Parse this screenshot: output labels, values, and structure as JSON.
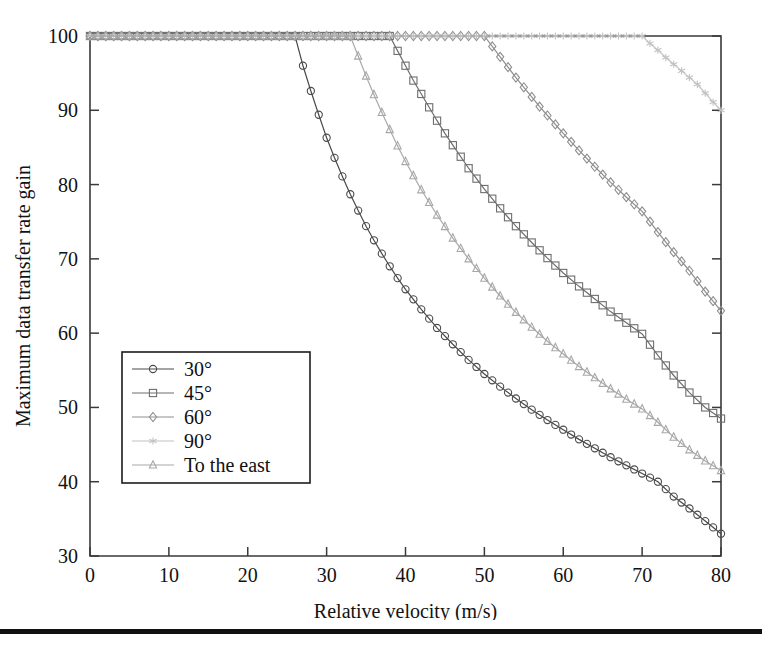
{
  "figure": {
    "background": "#ffffff",
    "bottom_rule_color": "#111111",
    "frame_color": "#3a3a3a"
  },
  "chart_data": {
    "type": "line",
    "title": "",
    "xlabel": "Relative velocity (m/s)",
    "ylabel": "Maximum data transfer rate gain",
    "xlim": [
      0,
      80
    ],
    "ylim": [
      30,
      100
    ],
    "xticks": [
      0,
      10,
      20,
      30,
      40,
      50,
      60,
      70,
      80
    ],
    "yticks": [
      30,
      40,
      50,
      60,
      70,
      80,
      90,
      100
    ],
    "xtick_labels": [
      "0",
      "10",
      "20",
      "30",
      "40",
      "50",
      "60",
      "70",
      "80"
    ],
    "ytick_labels": [
      "30",
      "40",
      "50",
      "60",
      "70",
      "80",
      "90",
      "100"
    ],
    "grid": false,
    "legend_position": "center-left",
    "marker_interval_x": 1,
    "series": [
      {
        "name": "30°",
        "label": "30°",
        "marker": "circle",
        "color": "#4a4a4a",
        "knee_x": 26,
        "x": [
          0,
          2,
          4,
          6,
          8,
          10,
          12,
          14,
          16,
          18,
          20,
          22,
          24,
          26,
          27,
          28,
          29,
          30,
          31,
          32,
          33,
          34,
          35,
          36,
          37,
          38,
          39,
          40,
          42,
          44,
          46,
          48,
          50,
          52,
          54,
          56,
          58,
          60,
          62,
          64,
          66,
          68,
          70,
          72,
          74,
          76,
          78,
          80
        ],
        "y": [
          100,
          100,
          100,
          100,
          100,
          100,
          100,
          100,
          100,
          100,
          100,
          100,
          100,
          100,
          96.0,
          92.6,
          89.4,
          86.3,
          83.6,
          81.1,
          78.7,
          76.5,
          74.4,
          72.5,
          70.7,
          69.0,
          67.4,
          65.9,
          63.2,
          60.7,
          58.5,
          56.4,
          54.5,
          52.8,
          51.2,
          49.7,
          48.3,
          47.0,
          45.7,
          44.5,
          43.3,
          42.2,
          41.1,
          40.0,
          38.0,
          36.4,
          34.7,
          33.0
        ]
      },
      {
        "name": "45°",
        "label": "45°",
        "marker": "square",
        "color": "#6e6e6e",
        "knee_x": 38,
        "x": [
          0,
          5,
          10,
          15,
          20,
          25,
          30,
          34,
          36,
          38,
          39,
          40,
          41,
          42,
          43,
          44,
          45,
          46,
          48,
          50,
          52,
          54,
          56,
          58,
          60,
          62,
          64,
          66,
          68,
          70,
          72,
          74,
          76,
          78,
          80
        ],
        "y": [
          100,
          100,
          100,
          100,
          100,
          100,
          100,
          100,
          100,
          100,
          98.0,
          96.0,
          94.0,
          92.2,
          90.4,
          88.6,
          86.9,
          85.3,
          82.2,
          79.4,
          76.8,
          74.4,
          72.2,
          70.1,
          68.1,
          66.3,
          64.6,
          62.9,
          61.4,
          59.9,
          57.0,
          54.3,
          52.0,
          50.0,
          48.5
        ]
      },
      {
        "name": "60°",
        "label": "60°",
        "marker": "diamond",
        "color": "#8f8f8f",
        "knee_x": 50,
        "x": [
          0,
          10,
          20,
          30,
          40,
          46,
          48,
          50,
          51,
          52,
          53,
          54,
          55,
          56,
          57,
          58,
          60,
          62,
          64,
          66,
          68,
          70,
          72,
          74,
          76,
          78,
          80
        ],
        "y": [
          100,
          100,
          100,
          100,
          100,
          100,
          100,
          100,
          98.6,
          97.2,
          95.8,
          94.4,
          93.1,
          91.8,
          90.5,
          89.3,
          86.9,
          84.6,
          82.4,
          80.3,
          78.3,
          76.4,
          73.6,
          70.9,
          68.4,
          65.6,
          63.0
        ]
      },
      {
        "name": "90°",
        "label": "90°",
        "marker": "star",
        "color": "#c2c2c2",
        "knee_x": 70,
        "x": [
          0,
          10,
          20,
          30,
          40,
          50,
          60,
          66,
          68,
          70,
          71,
          72,
          73,
          74,
          75,
          76,
          77,
          78,
          79,
          80
        ],
        "y": [
          100,
          100,
          100,
          100,
          100,
          100,
          100,
          100,
          100,
          100,
          99.0,
          98.1,
          97.1,
          96.2,
          95.3,
          94.4,
          93.5,
          92.3,
          91.1,
          90.0
        ]
      },
      {
        "name": "To the east",
        "label": "To the east",
        "marker": "triangle",
        "color": "#a8a8a8",
        "knee_x": 33,
        "x": [
          0,
          5,
          10,
          15,
          20,
          25,
          30,
          32,
          33,
          34,
          35,
          36,
          37,
          38,
          39,
          40,
          42,
          44,
          46,
          48,
          50,
          52,
          54,
          56,
          58,
          60,
          62,
          64,
          66,
          68,
          70,
          72,
          74,
          76,
          78,
          80
        ],
        "y": [
          100,
          100,
          100,
          100,
          100,
          100,
          100,
          100,
          100,
          97.3,
          94.6,
          92.1,
          89.7,
          87.4,
          85.2,
          83.1,
          79.3,
          75.9,
          72.8,
          70.0,
          67.4,
          65.0,
          62.8,
          60.8,
          58.9,
          57.2,
          55.5,
          54.0,
          52.5,
          51.1,
          49.8,
          48.0,
          46.0,
          44.3,
          42.8,
          41.5
        ]
      }
    ]
  }
}
